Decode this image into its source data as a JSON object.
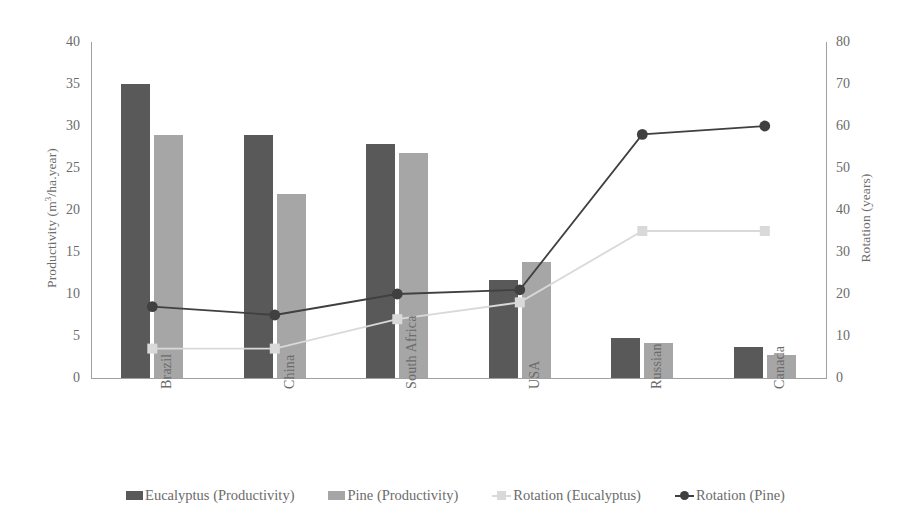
{
  "chart_data": {
    "type": "bar",
    "title": "",
    "subtitle": "",
    "categories": [
      "Brazil",
      "China",
      "South Africa",
      "USA",
      "Russian",
      "Canada"
    ],
    "xlabel": "",
    "ylabel": "Productivity (m³/ha.year)",
    "ylabel_parts": {
      "prefix": "Productivity (m",
      "sup": "3",
      "suffix": "/ha.year)"
    },
    "ylabel_secondary": "Rotation (years)",
    "ylim": [
      0,
      40
    ],
    "ylim_secondary": [
      0,
      80
    ],
    "yticks": [
      0,
      5,
      10,
      15,
      20,
      25,
      30,
      35,
      40
    ],
    "yticks_secondary": [
      0,
      10,
      20,
      30,
      40,
      50,
      60,
      70,
      80
    ],
    "grid": false,
    "legend_position": "bottom",
    "series": [
      {
        "name": "Eucalyptus (Productivity)",
        "kind": "bar",
        "axis": "left",
        "color": "#595959",
        "unit": "m³/ha.year",
        "values": [
          35.0,
          28.9,
          27.9,
          11.7,
          4.8,
          3.7
        ]
      },
      {
        "name": "Pine (Productivity)",
        "kind": "bar",
        "axis": "left",
        "color": "#a6a6a6",
        "unit": "m³/ha.year",
        "values": [
          28.9,
          21.9,
          26.8,
          13.8,
          4.2,
          2.7
        ]
      },
      {
        "name": "Rotation (Eucalyptus)",
        "kind": "line",
        "axis": "right",
        "color": "#d9d9d9",
        "marker": "square",
        "unit": "years",
        "values": [
          7,
          7,
          14,
          18,
          35,
          35
        ]
      },
      {
        "name": "Rotation (Pine)",
        "kind": "line",
        "axis": "right",
        "color": "#404040",
        "marker": "circle",
        "unit": "years",
        "values": [
          17,
          15,
          20,
          21,
          58,
          60
        ]
      }
    ]
  },
  "axes": {
    "left": {
      "title_prefix": "Productivity (m",
      "title_sup": "3",
      "title_suffix": "/ha.year)",
      "ticks": [
        "40",
        "35",
        "30",
        "25",
        "20",
        "15",
        "10",
        "5",
        "0"
      ]
    },
    "right": {
      "title": "Rotation (years)",
      "ticks": [
        "80",
        "70",
        "60",
        "50",
        "40",
        "30",
        "20",
        "10",
        "0"
      ]
    },
    "categories": [
      "Brazil",
      "China",
      "South Africa",
      "USA",
      "Russian",
      "Canada"
    ]
  },
  "legend": {
    "items": [
      {
        "label": "Eucalyptus (Productivity)",
        "type": "swatch",
        "color": "#595959",
        "icon": "square-swatch-icon"
      },
      {
        "label": "Pine (Productivity)",
        "type": "swatch",
        "color": "#a6a6a6",
        "icon": "square-swatch-icon"
      },
      {
        "label": "Rotation (Eucalyptus)",
        "type": "line-square",
        "color": "#d9d9d9",
        "icon": "line-square-marker-icon"
      },
      {
        "label": "Rotation (Pine)",
        "type": "line-circle",
        "color": "#404040",
        "icon": "line-circle-marker-icon"
      }
    ]
  },
  "colors": {
    "eucalyptus_bar": "#595959",
    "pine_bar": "#a6a6a6",
    "rotation_eucalyptus_line": "#d9d9d9",
    "rotation_pine_line": "#404040",
    "axis": "#a0a0a0",
    "text": "#6b6b6b",
    "background": "#ffffff"
  }
}
